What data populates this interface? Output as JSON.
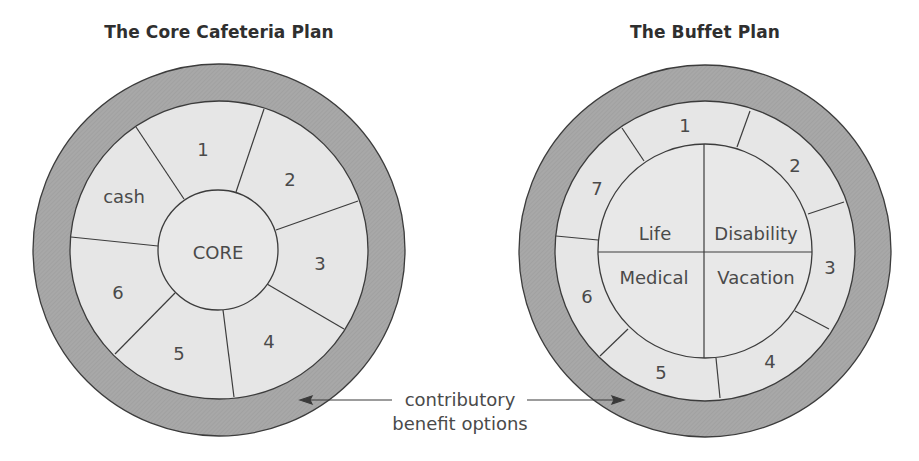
{
  "left_diagram": {
    "title": "The Core Cafeteria Plan",
    "center_label": "CORE",
    "segments": [
      "1",
      "2",
      "3",
      "4",
      "5",
      "6",
      "cash"
    ]
  },
  "right_diagram": {
    "title": "The Buffet Plan",
    "core_quadrants": [
      "Life",
      "Disability",
      "Medical",
      "Vacation"
    ],
    "segments": [
      "1",
      "2",
      "3",
      "4",
      "5",
      "6",
      "7"
    ]
  },
  "annotation": {
    "line1": "contributory",
    "line2": "benefit options"
  },
  "colors": {
    "outer_ring": "#a9a9a9",
    "inner_fill": "#e6e6e6",
    "stroke": "#3c3c3c",
    "text": "#4a4a4a"
  }
}
